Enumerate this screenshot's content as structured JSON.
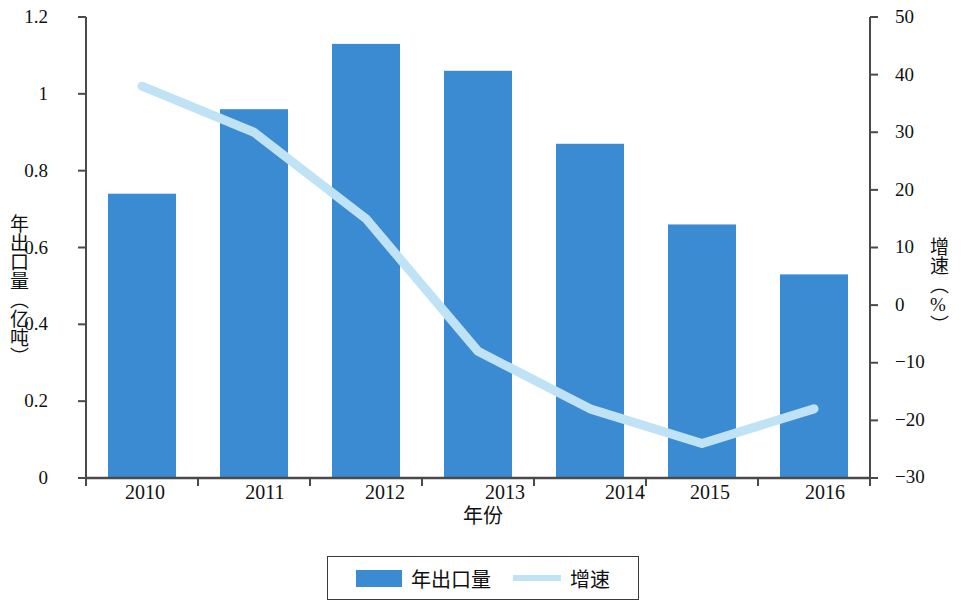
{
  "chart_data": {
    "type": "bar",
    "title": "",
    "xlabel": "年份",
    "categories": [
      "2010",
      "2011",
      "2012",
      "2013",
      "2014",
      "2015",
      "2016"
    ],
    "grid": false,
    "legend_position": "bottom",
    "series": [
      {
        "name": "年出口量",
        "type": "bar",
        "axis": "left",
        "unit": "亿吨",
        "color": "#3b8bd2",
        "values": [
          0.74,
          0.96,
          1.13,
          1.06,
          0.87,
          0.66,
          0.53
        ]
      },
      {
        "name": "增速",
        "type": "line",
        "axis": "right",
        "unit": "%",
        "color": "#bfe2f5",
        "values": [
          38,
          30,
          15,
          -8,
          -18,
          -24,
          -18
        ]
      }
    ],
    "axes": {
      "left": {
        "label": "年出口量（亿吨）",
        "ylim": [
          0,
          1.2
        ],
        "ticks": [
          0,
          0.2,
          0.4,
          0.6,
          0.8,
          1,
          1.2
        ],
        "ticklabels": [
          "0",
          "0.2",
          "0.4",
          "0.6",
          "0.8",
          "1",
          "1.2"
        ]
      },
      "right": {
        "label": "增速（%）",
        "ylim": [
          -30,
          50
        ],
        "ticks": [
          -30,
          -20,
          -10,
          0,
          10,
          20,
          30,
          40,
          50
        ],
        "ticklabels": [
          "−30",
          "−20",
          "−10",
          "0",
          "10",
          "20",
          "30",
          "40",
          "50"
        ]
      },
      "x": {
        "label": "年份",
        "ticklabels": [
          "2010",
          "2011",
          "2012",
          "2013",
          "2014",
          "2015",
          "2016"
        ]
      }
    },
    "legend": [
      {
        "name": "年出口量",
        "marker": "bar",
        "color": "#3b8bd2"
      },
      {
        "name": "增速",
        "marker": "line",
        "color": "#bfe2f5"
      }
    ]
  }
}
